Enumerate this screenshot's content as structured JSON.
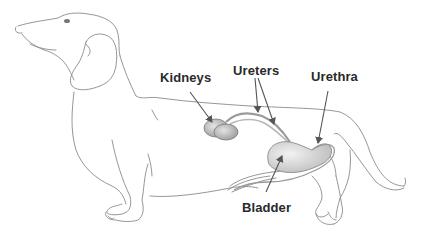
{
  "diagram": {
    "labels": {
      "kidneys": "Kidneys",
      "ureters": "Ureters",
      "urethra": "Urethra",
      "bladder": "Bladder"
    },
    "colors": {
      "outline": "#8a8a8a",
      "organ_fill": "#c9c9c9",
      "organ_shade": "#9a9a9a",
      "pointer": "#555555",
      "label_text": "#2a2a2a"
    }
  }
}
